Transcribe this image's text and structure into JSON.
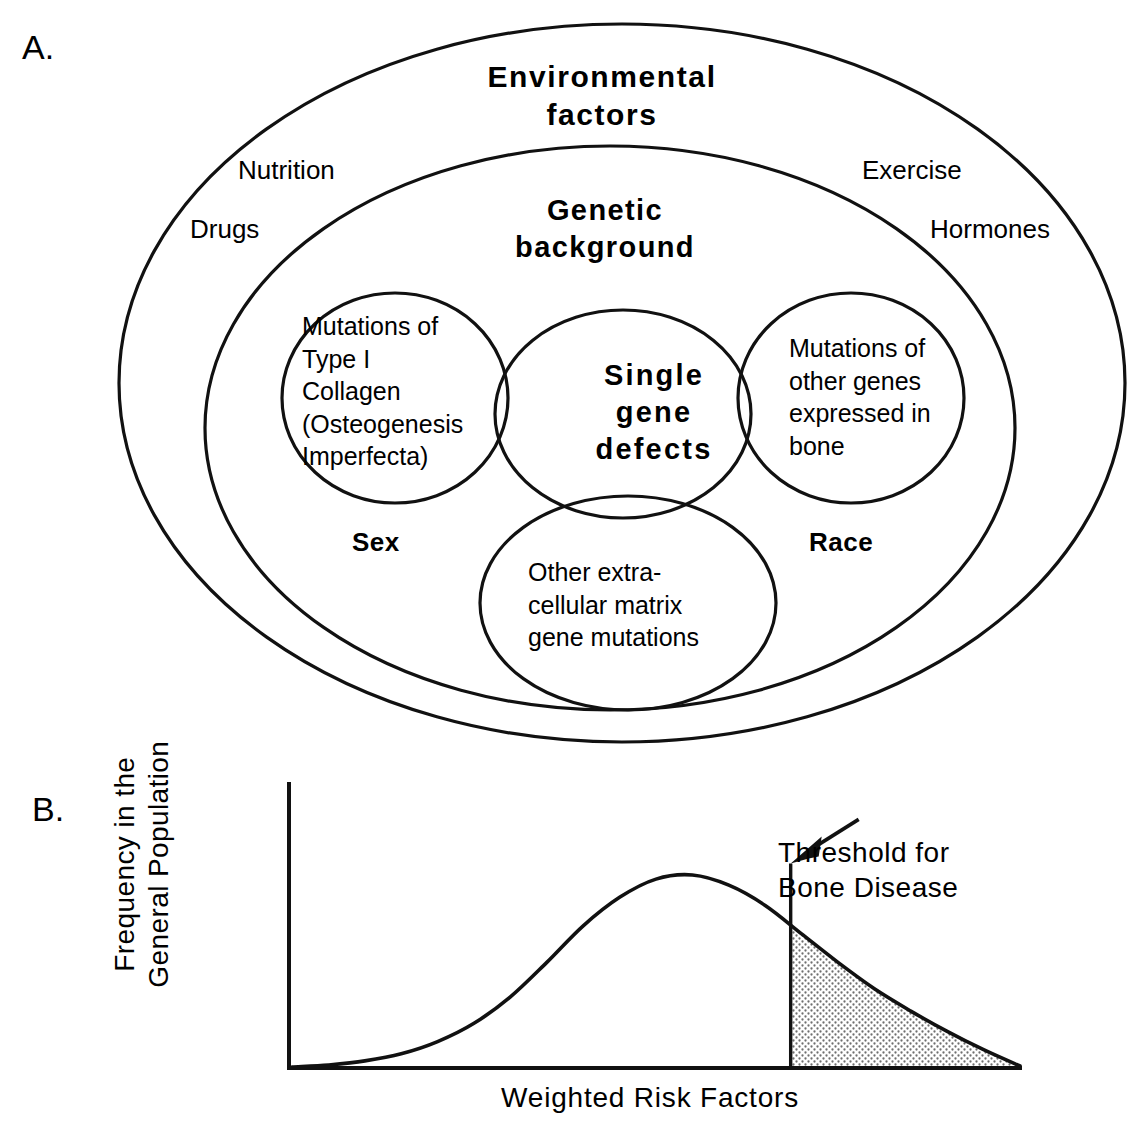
{
  "figure": {
    "panel_a_letter": "A.",
    "panel_b_letter": "B."
  },
  "panel_a": {
    "outer_ring_label": "Environmental\nfactors",
    "middle_ring_label": "Genetic\nbackground",
    "environmental_items": [
      {
        "label": "Nutrition"
      },
      {
        "label": "Drugs"
      },
      {
        "label": "Exercise"
      },
      {
        "label": "Hormones"
      }
    ],
    "genetic_items": [
      {
        "label": "Sex"
      },
      {
        "label": "Race"
      }
    ],
    "circles": [
      {
        "name": "left",
        "label": "Mutations of\nType I\nCollagen\n(Osteogenesis\nImperfecta)"
      },
      {
        "name": "center",
        "label": "Single\ngene\ndefects"
      },
      {
        "name": "right",
        "label": "Mutations of\nother genes\nexpressed in\nbone"
      },
      {
        "name": "bottom",
        "label": "Other  extra-\ncellular  matrix\ngene mutations"
      }
    ]
  },
  "panel_b": {
    "y_axis_label": "Frequency  in  the\nGeneral  Population",
    "x_axis_label": "Weighted  Risk  Factors",
    "annotation": "Threshold  for\nBone Disease"
  },
  "chart_data": {
    "type": "area",
    "title": "",
    "xlabel": "Weighted  Risk  Factors",
    "ylabel": "Frequency  in  the General  Population",
    "grid": false,
    "legend": null,
    "axis_ticks": {
      "x": [],
      "y": []
    },
    "xlim": [
      0,
      100
    ],
    "ylim": [
      0,
      100
    ],
    "series": [
      {
        "name": "Frequency distribution of weighted risk factors",
        "kind": "line",
        "x": [
          0,
          5,
          10,
          15,
          20,
          25,
          30,
          35,
          40,
          45,
          50,
          55,
          60,
          65,
          70,
          75,
          80,
          85,
          90,
          95,
          100
        ],
        "y": [
          0.5,
          1.5,
          3.5,
          7,
          13,
          22,
          35,
          52,
          70,
          84,
          93,
          95,
          90,
          80,
          66,
          52,
          39,
          28,
          18,
          9,
          1
        ]
      }
    ],
    "annotations": [
      {
        "name": "threshold",
        "text": "Threshold  for Bone Disease",
        "x": 68.5,
        "marker": "vertical-line-with-arrow",
        "shaded_region": {
          "from_x": 68.5,
          "to_x": 100,
          "fill": "stipple",
          "meaning": "population above threshold for bone disease"
        }
      }
    ]
  },
  "colors": {
    "ink": "#111111",
    "background": "#ffffff",
    "stipple": "#8a8a8a"
  }
}
